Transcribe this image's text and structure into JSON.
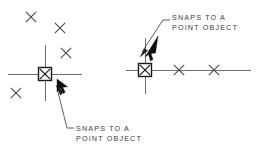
{
  "figure": {
    "background_color": "#ffffff",
    "line_color": "#4a4a4a",
    "crosshair_color": "#6e6e6e",
    "marker_color": "#1a1a1a",
    "text_color": "#3c3c3c"
  },
  "callouts": {
    "top": {
      "line1": "SNAPS TO A",
      "line2": "POINT OBJECT",
      "text_x": 172,
      "text_y1": 18,
      "text_y2": 28,
      "leader": "M 170 20 L 163 20 L 142 52",
      "arrow": "138 58 147 50 143 49"
    },
    "bottom": {
      "line1": "SNAPS TO A",
      "line2": "POINT OBJECT",
      "text_x": 74,
      "text_y1": 130,
      "text_y2": 140,
      "leader": "M 72 128 L 66 128 L 58 92",
      "arrow": "55 85 60 95 64 92"
    }
  },
  "left_scene": {
    "name": "free-point-cluster",
    "crosshair": {
      "cx": 45,
      "cy": 74,
      "h_x1": 8,
      "h_x2": 82,
      "v_y1": 45,
      "v_y2": 101
    },
    "snap_marker": {
      "cx": 45,
      "cy": 74,
      "size": 13
    },
    "points": [
      {
        "cx": 31,
        "cy": 17,
        "r": 5.2
      },
      {
        "cx": 60,
        "cy": 28,
        "r": 5.2
      },
      {
        "cx": 66,
        "cy": 53,
        "r": 5.2
      },
      {
        "cx": 16,
        "cy": 93,
        "r": 5.2
      }
    ],
    "cursor": {
      "x": 57,
      "y": 79
    }
  },
  "right_scene": {
    "name": "point-on-line",
    "line": {
      "x1": 126,
      "x2": 251,
      "y": 70
    },
    "crosshair": {
      "cx": 145,
      "cy": 70,
      "h_x1": 126,
      "h_x2": 251,
      "v_y1": 38,
      "v_y2": 94
    },
    "snap_marker": {
      "cx": 145,
      "cy": 70,
      "size": 13
    },
    "points": [
      {
        "cx": 179,
        "cy": 70,
        "r": 5.2
      },
      {
        "cx": 214,
        "cy": 70,
        "r": 5.2
      }
    ],
    "cursor": {
      "x": 144,
      "y": 55
    }
  }
}
